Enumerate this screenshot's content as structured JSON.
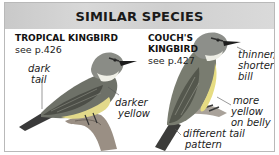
{
  "header": {
    "title": "SIMILAR SPECIES"
  },
  "species": [
    {
      "name": "TROPICAL KINGBIRD",
      "page": "see p.426",
      "notes": [
        "dark",
        "tail",
        "darker",
        "yellow"
      ]
    },
    {
      "name_line1": "COUCH'S",
      "name_line2": "KINGBIRD",
      "page": "see p.427",
      "notes": [
        "thinner,",
        "shorter",
        "bill",
        "more",
        "yellow",
        "on belly",
        "different tail",
        "pattern"
      ]
    }
  ],
  "colors": {
    "header_bg": "#d0d0d0",
    "border": "#b9b9b9",
    "text": "#1a1a1a"
  }
}
